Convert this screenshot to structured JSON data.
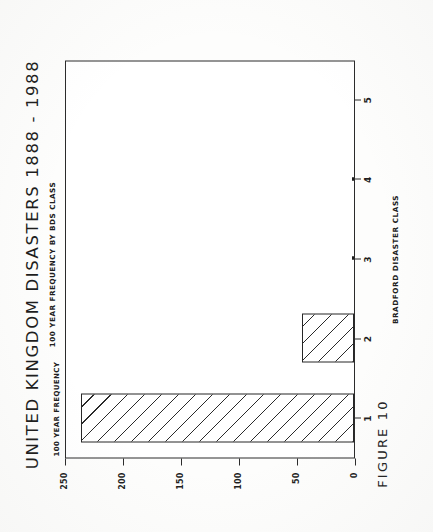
{
  "figure": {
    "caption": "FIGURE 10",
    "title": "UNITED KINGDOM DISASTERS  1888 - 1988",
    "subtitle": "100 YEAR FREQUENCY BY BDS CLASS"
  },
  "chart_data": {
    "type": "bar",
    "title": "UNITED KINGDOM DISASTERS  1888 - 1988",
    "subtitle": "100 YEAR FREQUENCY BY BDS CLASS",
    "xlabel": "BRADFORD DISASTER CLASS",
    "ylabel": "100 YEAR FREQUENCY",
    "categories": [
      "1",
      "2",
      "3",
      "4",
      "5"
    ],
    "values": [
      235,
      45,
      2,
      2,
      0
    ],
    "ylim": [
      0,
      250
    ],
    "yticks": [
      0,
      50,
      100,
      150,
      200,
      250
    ],
    "ytick_labels": [
      "0",
      "50",
      "100",
      "150",
      "200",
      "250"
    ],
    "xticks": [
      "1",
      "2",
      "3",
      "4",
      "5"
    ],
    "grid": false,
    "legend": false,
    "bar_fill": "diagonal-hatch",
    "orientation": "vertical-rotated-90",
    "line_color": "#2b2b2b"
  }
}
